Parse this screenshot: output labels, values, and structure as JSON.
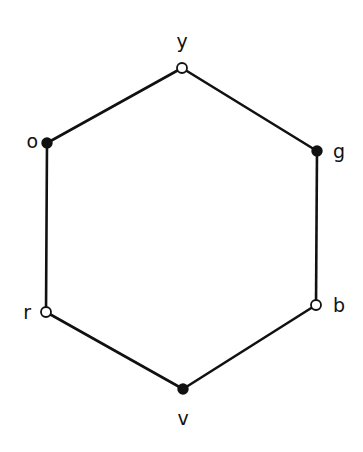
{
  "diagram": {
    "type": "hexagon-graph",
    "colors": {
      "line": "#111111",
      "open_fill": "#ffffff",
      "filled_fill": "#111111",
      "background": "#ffffff"
    },
    "nodes": [
      {
        "id": "y",
        "label": "y",
        "x": 182,
        "y": 68,
        "style": "open",
        "lx": 182,
        "ly": 48,
        "anchor": "middle"
      },
      {
        "id": "g",
        "label": "g",
        "x": 317,
        "y": 151,
        "style": "filled",
        "lx": 333,
        "ly": 158,
        "anchor": "start"
      },
      {
        "id": "b",
        "label": "b",
        "x": 316,
        "y": 305,
        "style": "open",
        "lx": 333,
        "ly": 312,
        "anchor": "start"
      },
      {
        "id": "v",
        "label": "v",
        "x": 183,
        "y": 389,
        "style": "filled",
        "lx": 183,
        "ly": 425,
        "anchor": "middle"
      },
      {
        "id": "r",
        "label": "r",
        "x": 46,
        "y": 312,
        "style": "open",
        "lx": 31,
        "ly": 319,
        "anchor": "end"
      },
      {
        "id": "o",
        "label": "o",
        "x": 47,
        "y": 143,
        "style": "filled",
        "lx": 38,
        "ly": 148,
        "anchor": "end"
      }
    ],
    "edges": [
      [
        "y",
        "g"
      ],
      [
        "g",
        "b"
      ],
      [
        "b",
        "v"
      ],
      [
        "v",
        "r"
      ],
      [
        "r",
        "o"
      ],
      [
        "o",
        "y"
      ]
    ]
  }
}
